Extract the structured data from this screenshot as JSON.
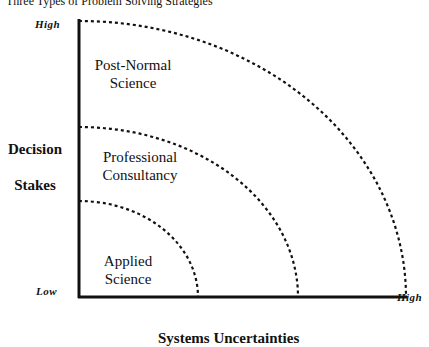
{
  "title": "Three Types of Problem Solving Strategies",
  "axes": {
    "y_label_line1": "Decision",
    "y_label_line2": "Stakes",
    "x_label": "Systems Uncertainties",
    "y_high": "High",
    "origin_low": "Low",
    "x_high": "High"
  },
  "regions": [
    {
      "line1": "Applied",
      "line2": "Science"
    },
    {
      "line1": "Professional",
      "line2": "Consultancy"
    },
    {
      "line1": "Post-Normal",
      "line2": "Science"
    }
  ]
}
